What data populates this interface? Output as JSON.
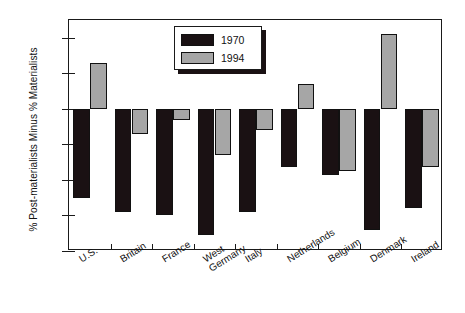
{
  "chart_data": {
    "type": "bar",
    "title": "",
    "subtitle": "",
    "xlabel": "",
    "ylabel": "% Post-materialists Minus % Materialists",
    "ylim": [
      -40,
      25
    ],
    "yticks": [
      20,
      10,
      0,
      -10,
      -20,
      -30,
      -40
    ],
    "ytick_labels": [
      "20",
      "10",
      "0",
      "-10",
      "-20",
      "-30",
      "-40"
    ],
    "grid": false,
    "legend_position": "top-center",
    "categories": [
      "U.S.",
      "Britain",
      "France",
      "West Germany",
      "Italy",
      "Netherlands",
      "Belgium",
      "Denmark",
      "Ireland"
    ],
    "category_lines": [
      [
        "U.S."
      ],
      [
        "Britain"
      ],
      [
        "France"
      ],
      [
        "West",
        "Germany"
      ],
      [
        "Italy"
      ],
      [
        "Netherlands"
      ],
      [
        "Belgium"
      ],
      [
        "Denmark"
      ],
      [
        "Ireland"
      ]
    ],
    "series": [
      {
        "name": "1970",
        "color": "#1a1113",
        "values": [
          -25,
          -29,
          -30,
          -35.5,
          -29,
          -16.5,
          -18.5,
          -34,
          -28
        ]
      },
      {
        "name": "1994",
        "color": "#a6a6a6",
        "values": [
          13,
          -7,
          -3,
          -13,
          -6,
          7,
          -17.5,
          21,
          -16.5
        ]
      }
    ]
  },
  "legend": {
    "entries": [
      {
        "label": "1970",
        "swatch": "black"
      },
      {
        "label": "1994",
        "swatch": "gray"
      }
    ]
  },
  "colors": {
    "series_1970": "#1a1113",
    "series_1994": "#a6a6a6",
    "axis": "#1a1a1a",
    "background": "#ffffff"
  }
}
